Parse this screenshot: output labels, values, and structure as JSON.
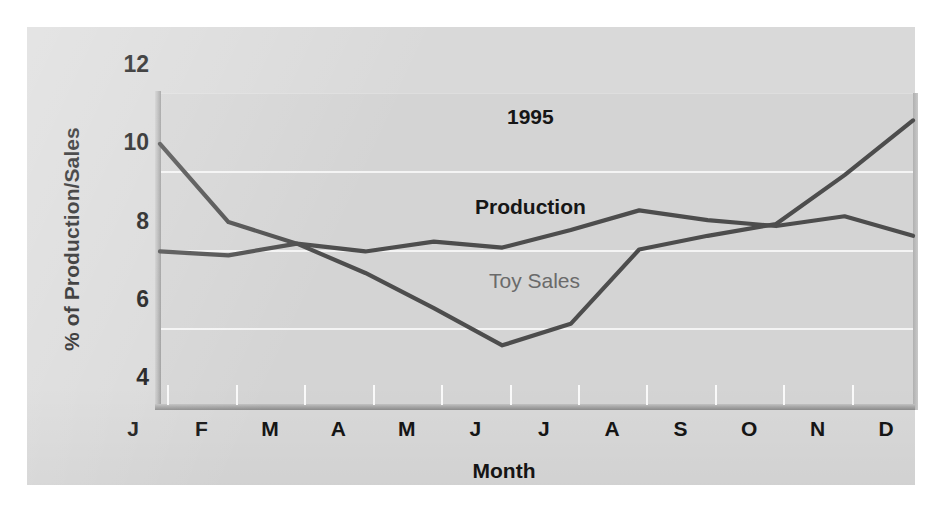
{
  "chart_data": {
    "type": "line",
    "title": "1995",
    "xlabel": "Month",
    "ylabel": "% of Production/Sales",
    "categories": [
      "J",
      "F",
      "M",
      "A",
      "M",
      "J",
      "J",
      "A",
      "S",
      "O",
      "N",
      "D"
    ],
    "xtick_labels": [
      "J",
      "F",
      "M",
      "A",
      "M",
      "J",
      "J",
      "A",
      "S",
      "O",
      "N",
      "D"
    ],
    "ytick_labels": [
      "12",
      "10",
      "8",
      "6",
      "4"
    ],
    "yticks": [
      12,
      10,
      8,
      6,
      4
    ],
    "ylim": [
      4,
      12
    ],
    "xlim": [
      0,
      11
    ],
    "grid": "horizontal white gridlines at 6, 8, 10",
    "legend_position": "inline annotations on plot",
    "series": [
      {
        "name": "Toy Sales",
        "color": "#4d4d4d",
        "label_style": "gray regular",
        "values": [
          10.7,
          8.7,
          8.15,
          7.4,
          6.5,
          5.55,
          6.1,
          8.0,
          8.35,
          8.65,
          9.9,
          11.3
        ]
      },
      {
        "name": "Production",
        "color": "#4d4d4d",
        "label_style": "black bold",
        "values": [
          7.95,
          7.85,
          8.15,
          7.95,
          8.2,
          8.05,
          8.5,
          9.0,
          8.75,
          8.6,
          8.85,
          8.35
        ]
      }
    ],
    "annotations": [
      {
        "text": "1995",
        "x_frac": 0.46,
        "y_value": 11.55
      },
      {
        "text": "Production",
        "x_frac": 0.42,
        "y_value": 9.2
      },
      {
        "text": "Toy Sales",
        "x_frac": 0.44,
        "y_value": 7.3
      }
    ]
  },
  "colors": {
    "panel_background": "#d9d9d9",
    "plot_background": "#d4d4d4",
    "gridline": "#f4f4f4",
    "series_stroke": "#4d4d4d",
    "axis_rule": "#a8a8a8",
    "text_primary": "#151515",
    "text_muted": "#6a6a6a"
  }
}
